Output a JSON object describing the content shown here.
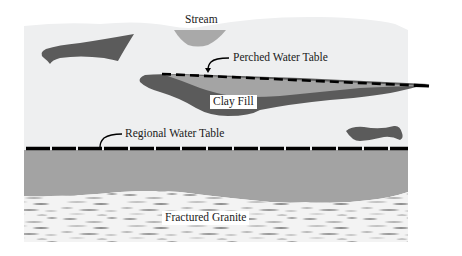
{
  "diagram": {
    "type": "geologic cross-section",
    "labels": {
      "stream": "Stream",
      "perched_water_table": "Perched Water Table",
      "clay_fill": "Clay Fill",
      "regional_water_table": "Regional Water Table",
      "fractured_granite": "Fractured Granite"
    },
    "colors": {
      "background": "#ffffff",
      "unsaturated_zone": "#eeeff0",
      "stream": "#a9a9a9",
      "clay_lens_dark": "#5b5b5b",
      "perched_water": "#a4a4a4",
      "saturated_zone": "#a3a3a3",
      "granite_light": "#f2f2f2",
      "granite_dark": "#8a8a8a",
      "water_table_line": "#000000"
    }
  }
}
